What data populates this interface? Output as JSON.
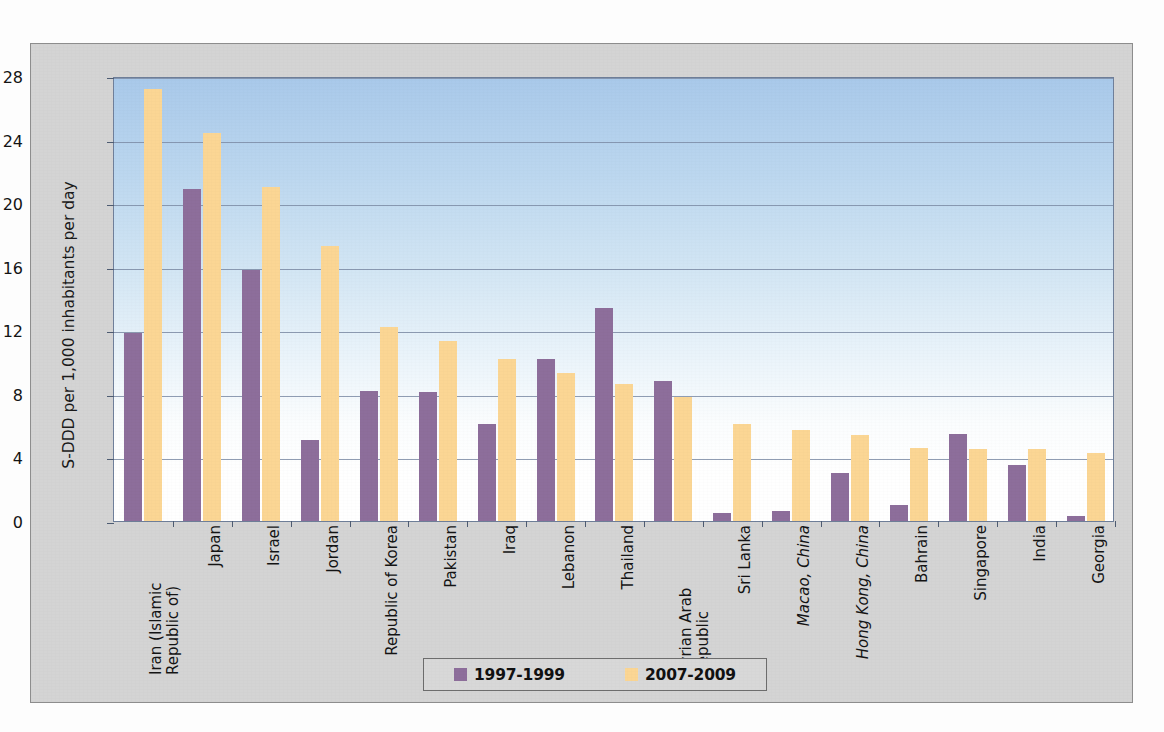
{
  "chart_data": {
    "type": "bar",
    "title": "",
    "xlabel": "",
    "ylabel": "S-DDD per 1,000 inhabitants per day",
    "ylim": [
      0,
      28
    ],
    "yticks": [
      0,
      4,
      8,
      12,
      16,
      20,
      24,
      28
    ],
    "grid": true,
    "legend_position": "bottom",
    "categories": [
      "Iran (Islamic Republic of)",
      "Japan",
      "Israel",
      "Jordan",
      "Republic of Korea",
      "Pakistan",
      "Iraq",
      "Lebanon",
      "Thailand",
      "Syrian Arab Republic",
      "Sri Lanka",
      "Macao, China",
      "Hong Kong, China",
      "Bahrain",
      "Singapore",
      "India",
      "Georgia"
    ],
    "category_styles": [
      "normal",
      "normal",
      "normal",
      "normal",
      "normal",
      "normal",
      "normal",
      "normal",
      "normal",
      "normal",
      "normal",
      "italic",
      "italic",
      "normal",
      "normal",
      "normal",
      "normal"
    ],
    "series": [
      {
        "name": "1997-1999",
        "color": "#8d6e9b",
        "values": [
          11.8,
          20.9,
          15.8,
          5.1,
          8.2,
          8.1,
          6.1,
          10.2,
          13.4,
          8.8,
          0.5,
          0.6,
          3.0,
          1.0,
          5.5,
          3.5,
          0.3
        ]
      },
      {
        "name": "2007-2009",
        "color": "#fbd694",
        "values": [
          27.2,
          24.4,
          21.0,
          17.3,
          12.2,
          11.3,
          10.2,
          9.3,
          8.6,
          7.8,
          6.1,
          5.7,
          5.4,
          4.6,
          4.5,
          4.5,
          4.3
        ]
      }
    ]
  },
  "legend": {
    "items": [
      {
        "label": "1997-1999",
        "color": "#8d6e9b"
      },
      {
        "label": "2007-2009",
        "color": "#fbd694"
      }
    ]
  },
  "axis": {
    "y_title": "S-DDD per 1,000 inhabitants per day",
    "y_tick_labels": [
      "0",
      "4",
      "8",
      "12",
      "16",
      "20",
      "24",
      "28"
    ]
  },
  "colors": {
    "series_1997_1999": "#8d6e9b",
    "series_2007_2009": "#fbd694",
    "plot_background_top": "#a9c9ea",
    "plot_background_bottom": "#ffffff",
    "frame_background": "#d4d4d4",
    "gridline": "#7c8ca6"
  }
}
